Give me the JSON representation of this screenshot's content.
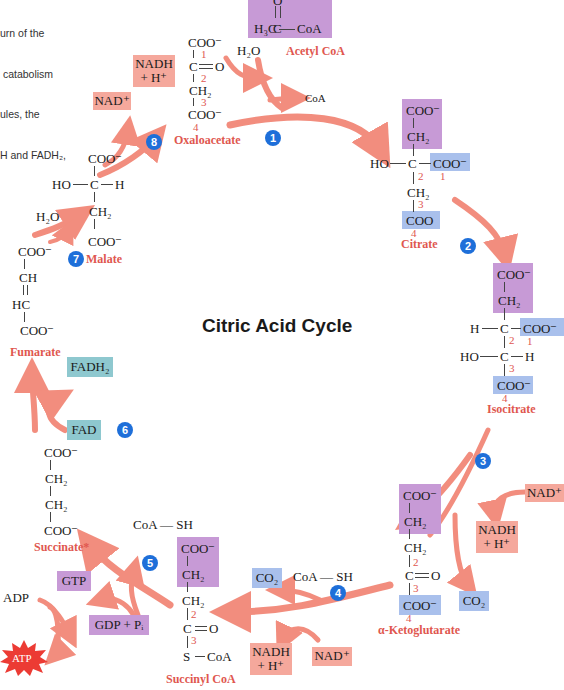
{
  "caption": {
    "lines": [
      "urn of the",
      " catabolism",
      "ules, the",
      "H and FADH₂,"
    ]
  },
  "title": "Citric Acid Cycle",
  "steps": [
    "1",
    "2",
    "3",
    "4",
    "5",
    "6",
    "7",
    "8"
  ],
  "molecules": {
    "acetyl_coa": {
      "name": "Acetyl CoA",
      "formula_left": "H₃C",
      "formula_mid": "C",
      "formula_right": "CoA",
      "oxygen": "O"
    },
    "oxaloacetate": {
      "name": "Oxaloacetate",
      "rows": [
        "COO⁻",
        "C",
        "CH₂",
        "COO⁻"
      ],
      "ketone": "O",
      "carbons": [
        "1",
        "2",
        "3",
        "4"
      ]
    },
    "citrate": {
      "name": "Citrate",
      "rows": [
        "COO⁻",
        "CH₂",
        "C",
        "CH₂",
        "COO"
      ],
      "left": "HO",
      "right": "COO⁻",
      "carbons": [
        "1",
        "2",
        "3",
        "4"
      ]
    },
    "isocitrate": {
      "name": "Isocitrate",
      "rows": [
        "COO⁻",
        "CH₂",
        "C",
        "C",
        "COO⁻"
      ],
      "left1": "H",
      "right1": "COO⁻",
      "left2": "HO",
      "right2": "H",
      "carbons": [
        "1",
        "2",
        "3",
        "4"
      ]
    },
    "alpha_ketoglutarate": {
      "name": "α-Ketoglutarate",
      "rows": [
        "COO⁻",
        "CH₂",
        "CH₂",
        "C",
        "COO⁻"
      ],
      "ketone": "O",
      "carbons": [
        "2",
        "3",
        "4"
      ]
    },
    "succinyl_coa": {
      "name": "Succinyl CoA",
      "rows": [
        "COO⁻",
        "CH₂",
        "CH₂",
        "C",
        "S"
      ],
      "ketone": "O",
      "thio": "CoA",
      "carbons": [
        "2",
        "3"
      ]
    },
    "succinate": {
      "name": "Succinate*",
      "rows": [
        "COO⁻",
        "CH₂",
        "CH₂",
        "COO⁻"
      ]
    },
    "fumarate": {
      "name": "Fumarate",
      "rows": [
        "COO⁻",
        "CH",
        "HC",
        "COO⁻"
      ]
    },
    "malate": {
      "name": "Malate",
      "rows": [
        "COO⁻",
        "C",
        "CH₂",
        "COO⁻"
      ],
      "left": "HO",
      "right": "H"
    }
  },
  "cofactors": {
    "h2o_top": "H₂O",
    "coa_top": "CoA",
    "nad_8": "NAD⁺",
    "nadh_8": [
      "NADH",
      "+ H⁺"
    ],
    "nad_3": "NAD⁺",
    "nadh_3": [
      "NADH",
      "+ H⁺"
    ],
    "co2_3": "CO₂",
    "co2_4": "CO₂",
    "coash_4": "CoA — SH",
    "nadh_4": [
      "NADH",
      "+ H⁺"
    ],
    "nad_4": "NAD⁺",
    "coash_5": "CoA — SH",
    "gtp": "GTP",
    "gdp": "GDP + Pᵢ",
    "adp": "ADP",
    "atp": "ATP",
    "fad": "FAD",
    "fadh2": "FADH₂",
    "h2o_7": "H₂O"
  },
  "colors": {
    "purple_box": "#c79ad6",
    "blue_box": "#a9c0ec",
    "salmon_box": "#f5a89c",
    "teal_box": "#8ec8cf",
    "arrow": "#f07a68",
    "label_red": "#e0574f",
    "step_blue": "#1e6fd9"
  }
}
